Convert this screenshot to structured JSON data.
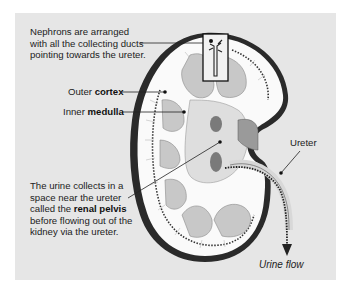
{
  "figure": {
    "type": "kidney-anatomy-cross-section",
    "colors": {
      "panel_background": "#e6e6e6",
      "capsule": "#2a2a2a",
      "cortex": "#fafafa",
      "medulla_pyramids": "#c8c8c8",
      "pelvis": "#dedede",
      "vessels": "#7a7a7a",
      "text": "#222222"
    }
  },
  "labels": {
    "nephrons": {
      "line1": "Nephrons are arranged",
      "line2": "with all the collecting ducts",
      "line3": "pointing towards the ureter."
    },
    "outer_cortex": {
      "prefix": "Outer ",
      "bold": "cortex"
    },
    "inner_medulla": {
      "prefix": "Inner ",
      "bold": "medulla"
    },
    "ureter": "Ureter",
    "renal_pelvis": {
      "line1": "The urine collects in a",
      "line2": "space near the ureter",
      "line3_prefix": "called the ",
      "line3_bold": "renal pelvis",
      "line4": "before flowing out of the",
      "line5": "kidney via the ureter."
    },
    "urine_flow": "Urine flow"
  }
}
